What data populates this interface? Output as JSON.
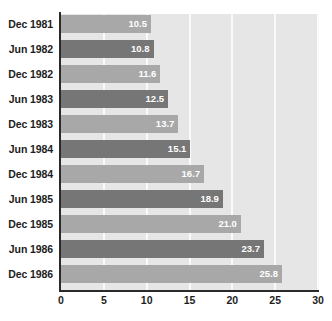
{
  "chart_data": {
    "type": "bar",
    "orientation": "horizontal",
    "title": "",
    "subtitle": "",
    "xlabel": "",
    "ylabel": "",
    "categories": [
      "Dec 1981",
      "Jun 1982",
      "Dec 1982",
      "Jun 1983",
      "Dec 1983",
      "Jun 1984",
      "Dec 1984",
      "Jun 1985",
      "Dec 1985",
      "Jun 1986",
      "Dec 1986"
    ],
    "values": [
      10.5,
      10.8,
      11.6,
      12.5,
      13.7,
      15.1,
      16.7,
      18.9,
      21.0,
      23.7,
      25.8
    ],
    "value_labels": [
      "10.5",
      "10.8",
      "11.6",
      "12.5",
      "13.7",
      "15.1",
      "16.7",
      "18.9",
      "21.0",
      "23.7",
      "25.8"
    ],
    "xlim": [
      0,
      30
    ],
    "xticks": [
      0,
      5,
      10,
      15,
      20,
      25,
      30
    ],
    "xtick_labels": [
      "0",
      "5",
      "10",
      "15",
      "20",
      "25",
      "30"
    ],
    "grid": true,
    "grid_axis": "x",
    "legend": null,
    "colors": {
      "bar_dark": "#767676",
      "bar_light": "#a8a8a8",
      "plot_background": "#e6e6e6",
      "gridline": "#fafafa",
      "axis_line": "#2a2a2a",
      "value_label_text": "#ffffff",
      "tick_label_text": "#1d1d1d",
      "page_background": "#ffffff"
    },
    "bar_color_pattern": [
      "light",
      "dark",
      "light",
      "dark",
      "light",
      "dark",
      "light",
      "dark",
      "light",
      "dark",
      "light"
    ]
  }
}
